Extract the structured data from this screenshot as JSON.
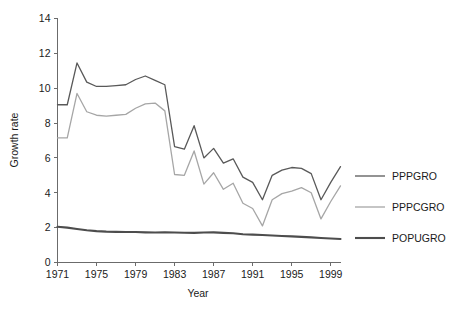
{
  "chart_data": {
    "type": "line",
    "title": "",
    "xlabel": "Year",
    "ylabel": "Growth rate",
    "xlim": [
      1971,
      2000
    ],
    "ylim": [
      0,
      14
    ],
    "xticks": [
      1971,
      1975,
      1979,
      1983,
      1987,
      1991,
      1995,
      1999
    ],
    "xtick_labels": [
      "1971",
      "1975",
      "1979",
      "1983",
      "1987",
      "1991",
      "1995",
      "1999"
    ],
    "yticks": [
      0,
      2,
      4,
      6,
      8,
      10,
      12,
      14
    ],
    "ytick_labels": [
      "0",
      "2",
      "4",
      "6",
      "8",
      "10",
      "12",
      "14"
    ],
    "grid": false,
    "legend_position": "right",
    "x": [
      1971,
      1972,
      1973,
      1974,
      1975,
      1976,
      1977,
      1978,
      1979,
      1980,
      1981,
      1982,
      1983,
      1984,
      1985,
      1986,
      1987,
      1988,
      1989,
      1990,
      1991,
      1992,
      1993,
      1994,
      1995,
      1996,
      1997,
      1998,
      1999,
      2000
    ],
    "series": [
      {
        "name": "PPPGRO",
        "color": "#595959",
        "width": 1.3,
        "values": [
          9.05,
          9.05,
          11.45,
          10.35,
          10.1,
          10.1,
          10.15,
          10.2,
          10.5,
          10.7,
          10.45,
          10.2,
          6.65,
          6.5,
          7.85,
          6.0,
          6.55,
          5.7,
          5.95,
          4.9,
          4.6,
          3.6,
          5.0,
          5.3,
          5.45,
          5.4,
          5.1,
          3.6,
          4.6,
          5.5
        ]
      },
      {
        "name": "PPPCGRO",
        "color": "#a6a6a6",
        "width": 1.3,
        "values": [
          7.15,
          7.15,
          9.7,
          8.65,
          8.45,
          8.4,
          8.45,
          8.5,
          8.85,
          9.1,
          9.15,
          8.7,
          5.05,
          5.0,
          6.4,
          4.5,
          5.15,
          4.2,
          4.55,
          3.4,
          3.1,
          2.1,
          3.6,
          3.95,
          4.1,
          4.3,
          4.0,
          2.5,
          3.5,
          4.4
        ]
      },
      {
        "name": "POPUGRO",
        "color": "#4d4d4d",
        "width": 2.1,
        "values": [
          2.05,
          2.0,
          1.92,
          1.85,
          1.8,
          1.77,
          1.76,
          1.75,
          1.75,
          1.73,
          1.72,
          1.73,
          1.72,
          1.71,
          1.7,
          1.72,
          1.73,
          1.7,
          1.68,
          1.62,
          1.6,
          1.58,
          1.55,
          1.52,
          1.5,
          1.47,
          1.44,
          1.41,
          1.38,
          1.35
        ]
      }
    ],
    "legend": [
      {
        "label": "PPPGRO",
        "color": "#595959",
        "width": 1.3
      },
      {
        "label": "PPPCGRO",
        "color": "#a6a6a6",
        "width": 1.3
      },
      {
        "label": "POPUGRO",
        "color": "#4d4d4d",
        "width": 2.1
      }
    ]
  },
  "axes_style": {
    "axis_color": "#6b6b6b",
    "text_color": "#1a1a1a"
  }
}
